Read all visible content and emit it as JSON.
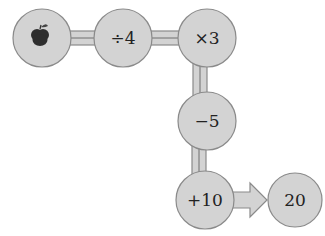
{
  "diagram": {
    "type": "function-machine-flow",
    "colors": {
      "node_fill": "#d3d3d3",
      "node_stroke": "#8a8a8a",
      "arrow": "#555555",
      "background": "#ffffff"
    },
    "nodes": [
      {
        "id": "start",
        "label": "",
        "icon": "apple-icon"
      },
      {
        "id": "op1",
        "label": "÷4"
      },
      {
        "id": "op2",
        "label": "×3"
      },
      {
        "id": "op3",
        "label": "−5"
      },
      {
        "id": "op4",
        "label": "+10"
      },
      {
        "id": "result",
        "label": "20"
      }
    ],
    "edges": [
      {
        "from": "start",
        "to": "op1"
      },
      {
        "from": "op1",
        "to": "op2"
      },
      {
        "from": "op2",
        "to": "op3"
      },
      {
        "from": "op3",
        "to": "op4"
      },
      {
        "from": "op4",
        "to": "result",
        "style": "big-arrow"
      }
    ]
  }
}
